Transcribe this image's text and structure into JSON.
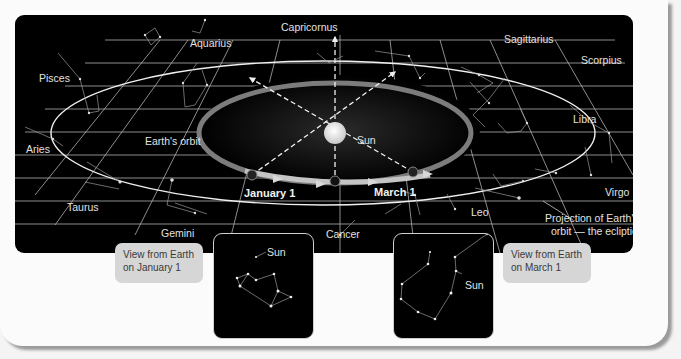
{
  "diagram": {
    "constellations": {
      "capricornus": "Capricornus",
      "aquarius": "Aquarius",
      "sagittarius": "Sagittarius",
      "scorpius": "Scorpius",
      "pisces": "Pisces",
      "libra": "Libra",
      "aries": "Aries",
      "virgo": "Virgo",
      "taurus": "Taurus",
      "gemini": "Gemini",
      "cancer": "Cancer",
      "leo": "Leo"
    },
    "labels": {
      "earths_orbit": "Earth's orbit",
      "sun": "Sun",
      "january_1": "January 1",
      "march_1": "March 1",
      "ecliptic_line1": "Projection of Earth's",
      "ecliptic_line2": "orbit — the ecliptic"
    },
    "insets": {
      "january": {
        "callout_line1": "View from Earth",
        "callout_line2": "on January 1",
        "sun_label": "Sun"
      },
      "march": {
        "callout_line1": "View from Earth",
        "callout_line2": "on March 1",
        "sun_label": "Sun"
      }
    },
    "colors": {
      "background": "#000000",
      "grid": "#bdbdbd",
      "orbit_arrow": "#8a8a8a",
      "card": "#fbfbfb",
      "callout": "#d6d6d6"
    }
  }
}
